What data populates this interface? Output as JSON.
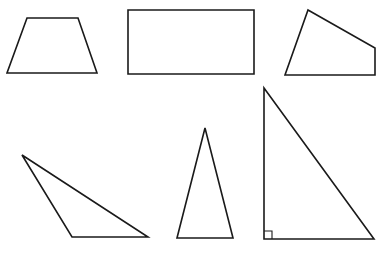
{
  "diagram": {
    "title": "",
    "stroke_color": "#1a1a1a",
    "background": "#ffffff",
    "shapes": [
      {
        "id": "trapezoid",
        "kind": "isosceles-trapezoid",
        "points": "27,18 78,18 97,73 7,73"
      },
      {
        "id": "rectangle",
        "kind": "rectangle",
        "points": "128,10 254,10 254,74 128,74"
      },
      {
        "id": "irregular-quadrilateral",
        "kind": "quadrilateral",
        "points": "308,10 375,48 375,75 285,75"
      },
      {
        "id": "obtuse-triangle",
        "kind": "obtuse-scalene-triangle",
        "points": "22,155 72,237 148,237"
      },
      {
        "id": "isosceles-triangle",
        "kind": "acute-isosceles-triangle",
        "points": "205,128 233,238 177,238"
      },
      {
        "id": "right-triangle",
        "kind": "right-triangle",
        "points": "264,88 374,239 264,239"
      }
    ],
    "right_angle_marker": {
      "points": "264,231 272,231 272,239"
    }
  }
}
